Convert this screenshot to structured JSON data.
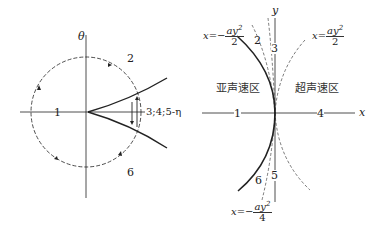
{
  "left_diagram": {
    "vertical_axis_label": "θ",
    "horizontal_axis_label": "3;4;5-η",
    "region_labels": [
      "1",
      "2",
      "6"
    ]
  },
  "right_diagram": {
    "x_axis_label": "x",
    "y_axis_label": "y",
    "line_labels": [
      "1",
      "2",
      "3",
      "4",
      "5",
      "6"
    ],
    "region_subsonic": "亚声速区",
    "region_supersonic": "超声速区",
    "curves": [
      {
        "lhs": "x=−",
        "num": "ay",
        "exp": "2",
        "den": "2",
        "position": "upper-left"
      },
      {
        "lhs": "x=",
        "num": "ay",
        "exp": "2",
        "den": "2",
        "position": "upper-right"
      },
      {
        "lhs": "x=−",
        "num": "ay",
        "exp": "2",
        "den": "4",
        "position": "lower-left"
      }
    ]
  }
}
